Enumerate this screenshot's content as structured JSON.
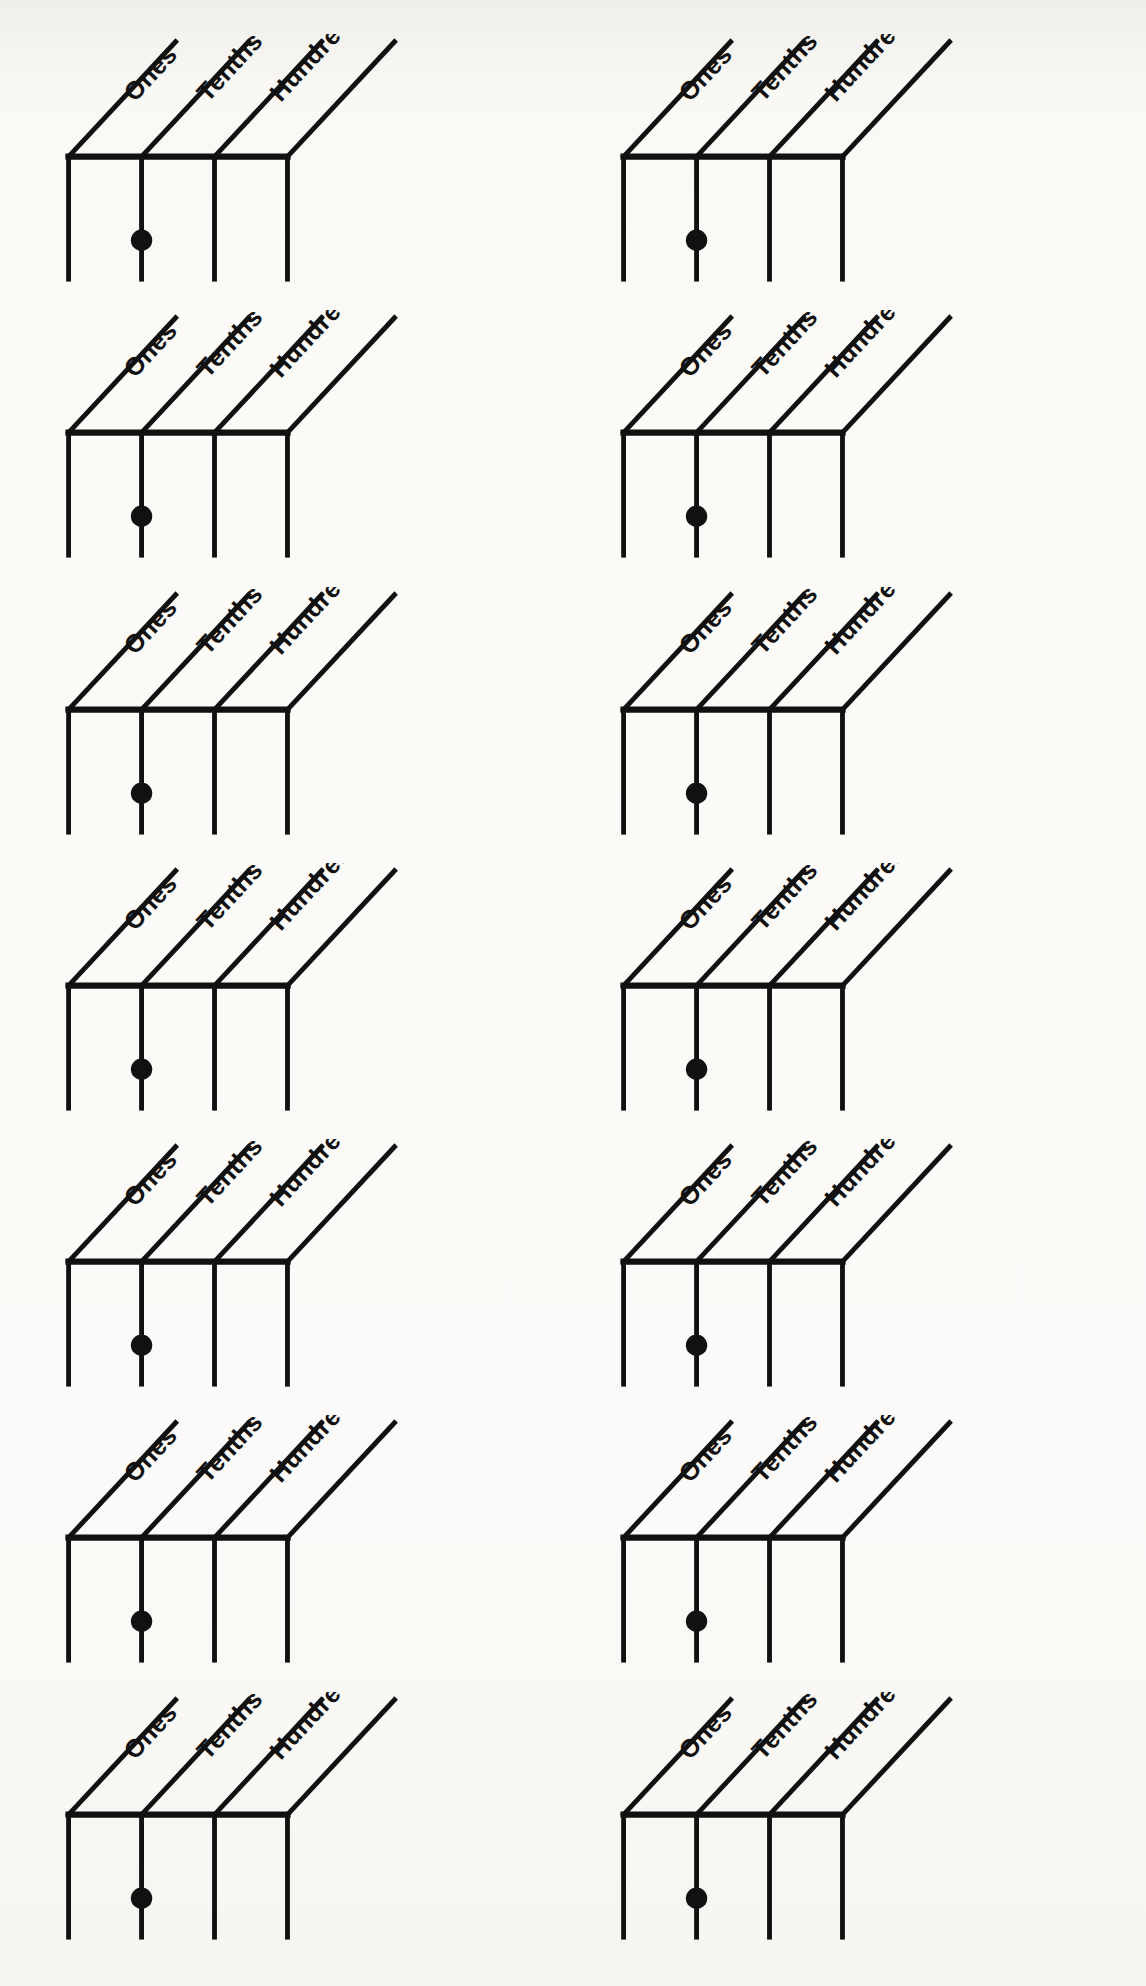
{
  "document": {
    "type": "place-value-chart-worksheet",
    "page_background_color": "#f7f6f2",
    "ink_color": "#111111",
    "columns": 2,
    "rows": 7,
    "chart_count": 14
  },
  "chart_template": {
    "headers": [
      {
        "id": "ones",
        "label": "Ones"
      },
      {
        "id": "tenths",
        "label": "Tenths"
      },
      {
        "id": "hundredths",
        "label": "Hundredths"
      }
    ],
    "cells": [
      "",
      "",
      ""
    ],
    "decimal_point": {
      "symbol": "•",
      "position": "between-ones-and-tenths",
      "filled": true
    },
    "divider_count": 4
  },
  "charts": [
    {
      "index": 1,
      "row": 1,
      "column": "left",
      "headers": [
        "Ones",
        "Tenths",
        "Hundredths"
      ],
      "values": [
        "",
        "",
        ""
      ],
      "decimal_point": "•"
    },
    {
      "index": 2,
      "row": 1,
      "column": "right",
      "headers": [
        "Ones",
        "Tenths",
        "Hundredths"
      ],
      "values": [
        "",
        "",
        ""
      ],
      "decimal_point": "•"
    },
    {
      "index": 3,
      "row": 2,
      "column": "left",
      "headers": [
        "Ones",
        "Tenths",
        "Hundredths"
      ],
      "values": [
        "",
        "",
        ""
      ],
      "decimal_point": "•"
    },
    {
      "index": 4,
      "row": 2,
      "column": "right",
      "headers": [
        "Ones",
        "Tenths",
        "Hundredths"
      ],
      "values": [
        "",
        "",
        ""
      ],
      "decimal_point": "•"
    },
    {
      "index": 5,
      "row": 3,
      "column": "left",
      "headers": [
        "Ones",
        "Tenths",
        "Hundredths"
      ],
      "values": [
        "",
        "",
        ""
      ],
      "decimal_point": "•"
    },
    {
      "index": 6,
      "row": 3,
      "column": "right",
      "headers": [
        "Ones",
        "Tenths",
        "Hundredths"
      ],
      "values": [
        "",
        "",
        ""
      ],
      "decimal_point": "•"
    },
    {
      "index": 7,
      "row": 4,
      "column": "left",
      "headers": [
        "Ones",
        "Tenths",
        "Hundredths"
      ],
      "values": [
        "",
        "",
        ""
      ],
      "decimal_point": "•"
    },
    {
      "index": 8,
      "row": 4,
      "column": "right",
      "headers": [
        "Ones",
        "Tenths",
        "Hundredths"
      ],
      "values": [
        "",
        "",
        ""
      ],
      "decimal_point": "•"
    },
    {
      "index": 9,
      "row": 5,
      "column": "left",
      "headers": [
        "Ones",
        "Tenths",
        "Hundredths"
      ],
      "values": [
        "",
        "",
        ""
      ],
      "decimal_point": "•"
    },
    {
      "index": 10,
      "row": 5,
      "column": "right",
      "headers": [
        "Ones",
        "Tenths",
        "Hundredths"
      ],
      "values": [
        "",
        "",
        ""
      ],
      "decimal_point": "•"
    },
    {
      "index": 11,
      "row": 6,
      "column": "left",
      "headers": [
        "Ones",
        "Tenths",
        "Hundredths"
      ],
      "values": [
        "",
        "",
        ""
      ],
      "decimal_point": "•"
    },
    {
      "index": 12,
      "row": 6,
      "column": "right",
      "headers": [
        "Ones",
        "Tenths",
        "Hundredths"
      ],
      "values": [
        "",
        "",
        ""
      ],
      "decimal_point": "•"
    },
    {
      "index": 13,
      "row": 7,
      "column": "left",
      "headers": [
        "Ones",
        "Tenths",
        "Hundredths"
      ],
      "values": [
        "",
        "",
        ""
      ],
      "decimal_point": "•"
    },
    {
      "index": 14,
      "row": 7,
      "column": "right",
      "headers": [
        "Ones",
        "Tenths",
        "Hundredths"
      ],
      "values": [
        "",
        "",
        ""
      ],
      "decimal_point": "•"
    }
  ]
}
